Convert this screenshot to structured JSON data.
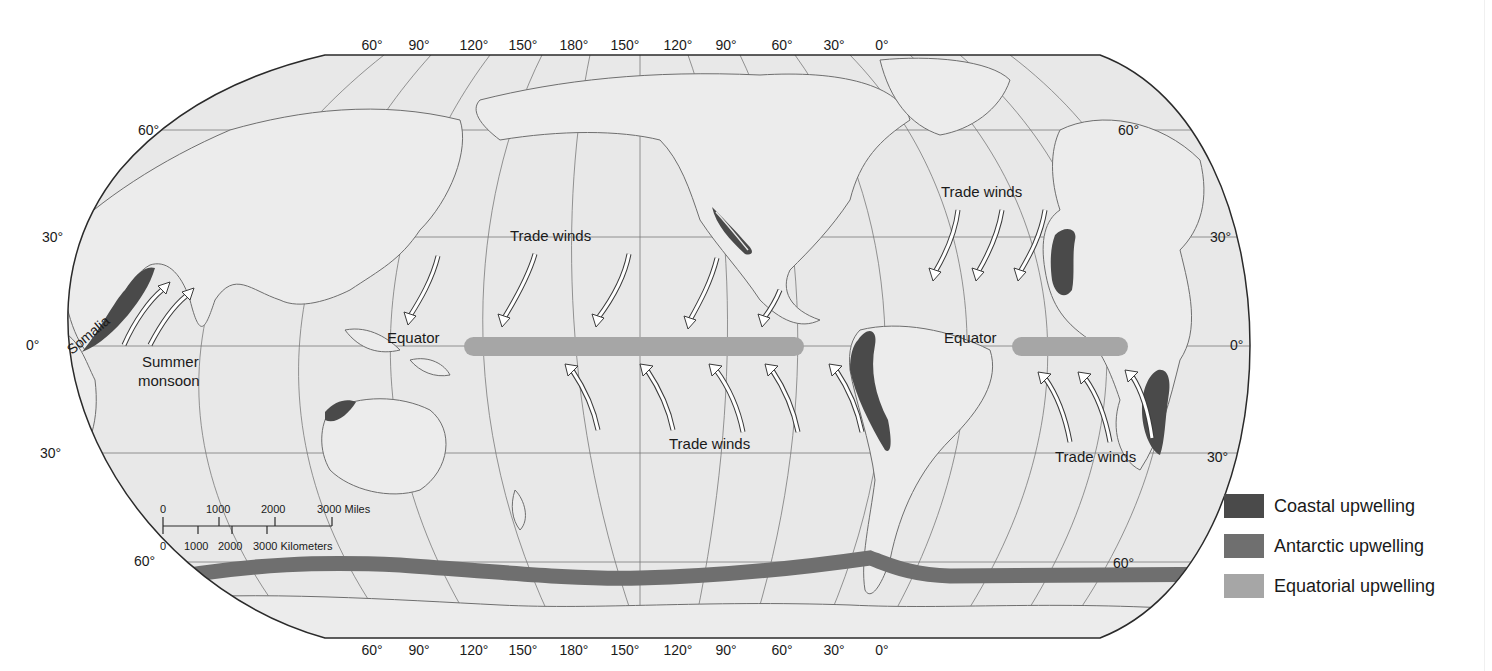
{
  "map": {
    "title": "",
    "colors": {
      "ocean": "#e6e6e6",
      "land": "#e9e9e9",
      "coast": "#6e6e6e",
      "grid": "#7a7a7a",
      "border": "#2a2a2a",
      "coastal_upwelling": "#4a4a4a",
      "antarctic_upwelling": "#6f6f6f",
      "equatorial_upwelling": "#a6a6a6"
    },
    "longitude_labels_top": [
      "60°",
      "90°",
      "120°",
      "150°",
      "180°",
      "150°",
      "120°",
      "90°",
      "60°",
      "30°",
      "0°"
    ],
    "longitude_labels_bottom": [
      "60°",
      "90°",
      "120°",
      "150°",
      "180°",
      "150°",
      "120°",
      "90°",
      "60°",
      "30°",
      "0°"
    ],
    "latitude_labels_left": [
      "60°",
      "30°",
      "0°",
      "30°",
      "60°"
    ],
    "latitude_labels_right": [
      "60°",
      "30°",
      "0°",
      "30°",
      "60°"
    ],
    "annotations": {
      "somalia": "Somalia",
      "summer_monsoon_line1": "Summer",
      "summer_monsoon_line2": "monsoon",
      "trade_winds_npac": "Trade winds",
      "trade_winds_natl": "Trade winds",
      "trade_winds_spac": "Trade winds",
      "trade_winds_satl": "Trade winds",
      "equator_pac": "Equator",
      "equator_atl": "Equator"
    },
    "scale_bar": {
      "miles_ticks": [
        "0",
        "1000",
        "2000",
        "3000 Miles"
      ],
      "km_ticks": [
        "0",
        "1000",
        "2000",
        "3000 Kilometers"
      ]
    }
  },
  "legend": {
    "items": [
      {
        "label": "Coastal upwelling",
        "color": "#4a4a4a"
      },
      {
        "label": "Antarctic upwelling",
        "color": "#6f6f6f"
      },
      {
        "label": "Equatorial upwelling",
        "color": "#a6a6a6"
      }
    ]
  }
}
